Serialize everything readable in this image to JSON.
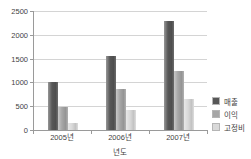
{
  "chart_data": {
    "type": "bar",
    "categories": [
      "2005년",
      "2006년",
      "2007년"
    ],
    "series": [
      {
        "name": "매출",
        "color": "#575757",
        "values": [
          1000,
          1550,
          2280
        ]
      },
      {
        "name": "이익",
        "color": "#a6a6a6",
        "values": [
          490,
          860,
          1230
        ]
      },
      {
        "name": "고정비",
        "color": "#d9d9d9",
        "values": [
          150,
          420,
          660
        ]
      }
    ],
    "title": "",
    "xlabel": "년도",
    "ylabel": "",
    "ylim": [
      0,
      2500
    ],
    "yticks": [
      0,
      500,
      1000,
      1500,
      2000,
      2500
    ],
    "grid": true,
    "legend_position": "right"
  },
  "colors": {
    "axis": "#9a9a9a",
    "gridline": "#d4d4d4",
    "text": "#3f3f3f",
    "background": "#ffffff"
  }
}
